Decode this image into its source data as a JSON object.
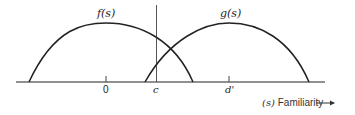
{
  "diagram": {
    "curves": [
      {
        "name": "f",
        "label": "f(s)"
      },
      {
        "name": "g",
        "label": "g(s)"
      }
    ],
    "ticks": {
      "zero": "0",
      "criterion": "c",
      "d_prime": "d'"
    },
    "axis": {
      "variable": "(s)",
      "label": "Familiarity",
      "arrow": "—→"
    }
  }
}
